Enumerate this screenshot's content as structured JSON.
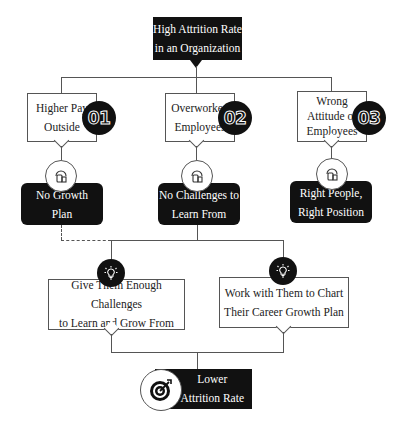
{
  "root": {
    "label": "High Attrition Rate\nin an Organization"
  },
  "causes": [
    {
      "label": "Higher Pay\nOutside",
      "number": "01"
    },
    {
      "label": "Overworked\nEmployees",
      "number": "02"
    },
    {
      "label": "Wrong\nAttitude of\nEmployees",
      "number": "03"
    }
  ],
  "effects": [
    {
      "label": "No Growth\nPlan",
      "icon": "person-device-icon"
    },
    {
      "label": "No Challenges to\nLearn From",
      "icon": "person-device-icon"
    },
    {
      "label": "Right People,\nRight Position",
      "icon": "person-device-icon"
    }
  ],
  "solutions": [
    {
      "label": "Give Them Enough Challenges\nto Learn and Grow  From",
      "icon": "lightbulb-icon"
    },
    {
      "label": "Work with Them to Chart\nTheir Career Growth Plan",
      "icon": "lightbulb-icon"
    }
  ],
  "outcome": {
    "label": "Lower\nAttrition Rate",
    "icon": "target-icon"
  },
  "colors": {
    "dark": "#111111",
    "line": "#555555",
    "background": "#ffffff"
  }
}
